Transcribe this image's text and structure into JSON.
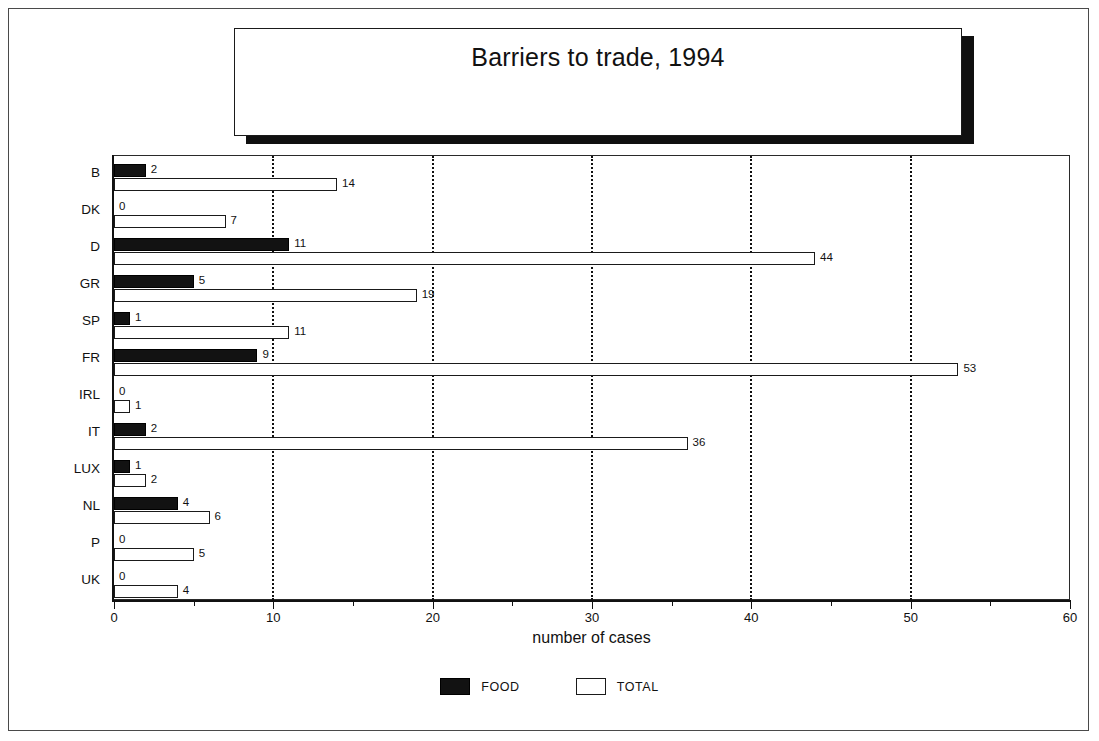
{
  "title": "Barriers to trade, 1994",
  "legend": [
    {
      "key": "food",
      "label": "FOOD",
      "color": "#121212",
      "filled": true
    },
    {
      "key": "total",
      "label": "TOTAL",
      "color": "#ffffff",
      "filled": false
    }
  ],
  "axis": {
    "x_title": "number of cases",
    "x_ticks": [
      "0",
      "10",
      "20",
      "30",
      "40",
      "50",
      "60"
    ]
  },
  "chart_data": {
    "type": "bar",
    "orientation": "horizontal",
    "title": "Barriers to trade, 1994",
    "xlabel": "number of cases",
    "ylabel": "",
    "xlim": [
      0,
      60
    ],
    "xticks": [
      0,
      10,
      20,
      30,
      40,
      50,
      60
    ],
    "xminorticks": [
      5,
      15,
      25,
      35,
      45,
      55
    ],
    "grid": "vertical-dotted-at-10-20-30-40-50",
    "legend_position": "bottom-center",
    "categories": [
      "B",
      "DK",
      "D",
      "GR",
      "SP",
      "FR",
      "IRL",
      "IT",
      "LUX",
      "NL",
      "P",
      "UK"
    ],
    "series": [
      {
        "name": "FOOD",
        "color": "#121212",
        "values": [
          2,
          0,
          11,
          5,
          1,
          9,
          0,
          2,
          1,
          4,
          0,
          0
        ]
      },
      {
        "name": "TOTAL",
        "color": "#ffffff",
        "values": [
          14,
          7,
          44,
          19,
          11,
          53,
          1,
          36,
          2,
          6,
          5,
          4
        ]
      }
    ],
    "data_labels": {
      "B": {
        "FOOD": "2",
        "TOTAL": "14"
      },
      "DK": {
        "FOOD": "0",
        "TOTAL": "7"
      },
      "D": {
        "FOOD": "11",
        "TOTAL": "44"
      },
      "GR": {
        "FOOD": "5",
        "TOTAL": "19"
      },
      "SP": {
        "FOOD": "1",
        "TOTAL": "11"
      },
      "FR": {
        "FOOD": "9",
        "TOTAL": "53"
      },
      "IRL": {
        "FOOD": "0",
        "TOTAL": "1"
      },
      "IT": {
        "FOOD": "2",
        "TOTAL": "36"
      },
      "LUX": {
        "FOOD": "1",
        "TOTAL": "2"
      },
      "NL": {
        "FOOD": "4",
        "TOTAL": "6"
      },
      "P": {
        "FOOD": "0",
        "TOTAL": "5"
      },
      "UK": {
        "FOOD": "0",
        "TOTAL": "4"
      }
    }
  }
}
